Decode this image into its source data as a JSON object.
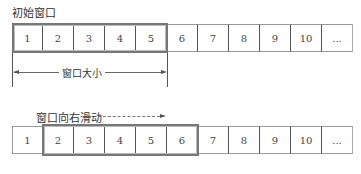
{
  "diagram": {
    "top": {
      "title": "初始窗口",
      "cells": [
        "1",
        "2",
        "3",
        "4",
        "5",
        "6",
        "7",
        "8",
        "9",
        "10",
        "..."
      ],
      "window_range": [
        1,
        5
      ],
      "size_label": "窗口大小"
    },
    "bottom": {
      "title": "窗口向右滑动",
      "cells": [
        "1",
        "2",
        "3",
        "4",
        "5",
        "6",
        "7",
        "8",
        "9",
        "10",
        "..."
      ],
      "window_range": [
        2,
        6
      ]
    }
  }
}
